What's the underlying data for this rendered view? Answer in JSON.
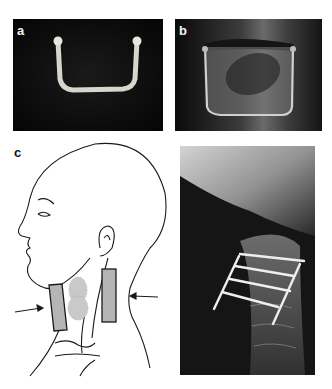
{
  "figure": {
    "panels": [
      {
        "id": "a",
        "label": "a",
        "description": "Photograph of U-shaped metal staple implant on dark background"
      },
      {
        "id": "b",
        "label": "b",
        "description": "Radiograph of U-shaped implant positioned across a vertebral body"
      },
      {
        "id": "c",
        "label": "c",
        "description": "Line drawing of head and neck in profile with two shaded rectangular pads on the neck and arrows indicating compression from front and back"
      },
      {
        "id": "d",
        "label": "",
        "description": "Lateral cervical spine X-ray showing multiple transverse pins and two longitudinal rods forming a frame"
      }
    ]
  },
  "colors": {
    "background": "#ffffff",
    "photo_dark": "#0b0b0b",
    "implant": "#d8d8d0",
    "pad_fill": "#b5b5b5",
    "line": "#1a1a1a"
  }
}
